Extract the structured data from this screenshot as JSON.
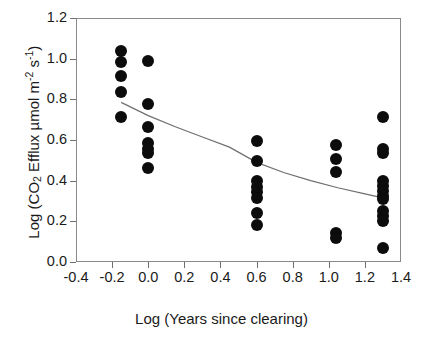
{
  "chart_data": {
    "type": "scatter",
    "title": "",
    "xlabel": "Log (Years since clearing)",
    "ylabel": "Log (CO2 Efflux umol m-2 s-1)",
    "ylabel_parts": {
      "prefix": "Log (CO",
      "sub1": "2",
      "mid": " Efflux µmol m",
      "sup1": "-2",
      "mid2": " s",
      "sup2": "-1",
      "suffix": ")"
    },
    "xlim": [
      -0.4,
      1.4
    ],
    "ylim": [
      0.0,
      1.2
    ],
    "xticks": [
      -0.4,
      -0.2,
      0.0,
      0.2,
      0.4,
      0.6,
      0.8,
      1.0,
      1.2,
      1.4
    ],
    "xtick_labels": [
      "-0.4",
      "-0.2",
      "0.0",
      "0.2",
      "0.4",
      "0.6",
      "0.8",
      "1.0",
      "1.2",
      "1.4"
    ],
    "yticks": [
      0.0,
      0.2,
      0.4,
      0.6,
      0.8,
      1.0,
      1.2
    ],
    "ytick_labels": [
      "0.0",
      "0.2",
      "0.4",
      "0.6",
      "0.8",
      "1.0",
      "1.2"
    ],
    "grid": false,
    "legend": false,
    "marker_color": "#0c0c0c",
    "marker_shape": "filled-circle",
    "marker_size_px": 12,
    "frame_color": "#8a8a8a",
    "curve_color": "#6f6f6f",
    "points": [
      {
        "x": -0.15,
        "y": 1.04
      },
      {
        "x": -0.15,
        "y": 0.985
      },
      {
        "x": -0.15,
        "y": 0.915
      },
      {
        "x": -0.15,
        "y": 0.835
      },
      {
        "x": -0.15,
        "y": 0.715
      },
      {
        "x": 0.0,
        "y": 0.99
      },
      {
        "x": 0.0,
        "y": 0.775
      },
      {
        "x": 0.0,
        "y": 0.665
      },
      {
        "x": 0.0,
        "y": 0.585
      },
      {
        "x": 0.0,
        "y": 0.555
      },
      {
        "x": 0.0,
        "y": 0.535
      },
      {
        "x": 0.0,
        "y": 0.46
      },
      {
        "x": 0.6,
        "y": 0.595
      },
      {
        "x": 0.6,
        "y": 0.495
      },
      {
        "x": 0.6,
        "y": 0.4
      },
      {
        "x": 0.6,
        "y": 0.37
      },
      {
        "x": 0.6,
        "y": 0.345
      },
      {
        "x": 0.6,
        "y": 0.315
      },
      {
        "x": 0.6,
        "y": 0.24
      },
      {
        "x": 0.6,
        "y": 0.18
      },
      {
        "x": 1.04,
        "y": 0.575
      },
      {
        "x": 1.04,
        "y": 0.505
      },
      {
        "x": 1.04,
        "y": 0.445
      },
      {
        "x": 1.04,
        "y": 0.145
      },
      {
        "x": 1.04,
        "y": 0.12
      },
      {
        "x": 1.3,
        "y": 0.715
      },
      {
        "x": 1.3,
        "y": 0.555
      },
      {
        "x": 1.3,
        "y": 0.535
      },
      {
        "x": 1.3,
        "y": 0.4
      },
      {
        "x": 1.3,
        "y": 0.375
      },
      {
        "x": 1.3,
        "y": 0.35
      },
      {
        "x": 1.3,
        "y": 0.325
      },
      {
        "x": 1.3,
        "y": 0.31
      },
      {
        "x": 1.3,
        "y": 0.25
      },
      {
        "x": 1.3,
        "y": 0.225
      },
      {
        "x": 1.3,
        "y": 0.2
      },
      {
        "x": 1.3,
        "y": 0.07
      }
    ],
    "fit_curve": {
      "label": "",
      "x_start": -0.15,
      "x_end": 1.3,
      "points": [
        {
          "x": -0.15,
          "y": 0.785
        },
        {
          "x": 0.0,
          "y": 0.72
        },
        {
          "x": 0.15,
          "y": 0.665
        },
        {
          "x": 0.3,
          "y": 0.615
        },
        {
          "x": 0.45,
          "y": 0.565
        },
        {
          "x": 0.6,
          "y": 0.49
        },
        {
          "x": 0.75,
          "y": 0.44
        },
        {
          "x": 0.9,
          "y": 0.4
        },
        {
          "x": 1.05,
          "y": 0.365
        },
        {
          "x": 1.2,
          "y": 0.335
        },
        {
          "x": 1.3,
          "y": 0.315
        }
      ]
    }
  }
}
